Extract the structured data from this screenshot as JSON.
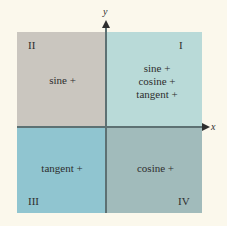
{
  "axes": {
    "x_label": "x",
    "y_label": "y"
  },
  "quadrants": {
    "q1": {
      "numeral": "I",
      "functions": [
        "sine +",
        "cosine +",
        "tangent +"
      ],
      "color": "#b9dad8"
    },
    "q2": {
      "numeral": "II",
      "functions": [
        "sine +"
      ],
      "color": "#cac6bf"
    },
    "q3": {
      "numeral": "III",
      "functions": [
        "tangent +"
      ],
      "color": "#90c5d0"
    },
    "q4": {
      "numeral": "IV",
      "functions": [
        "cosine +"
      ],
      "color": "#a1bbbb"
    }
  }
}
